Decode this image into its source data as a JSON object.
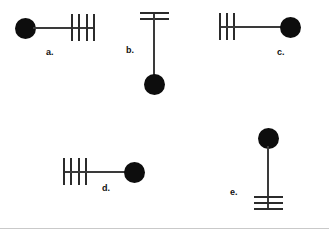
{
  "sheet": {
    "background_color": "#ffffff",
    "rule_color": "#c9c9c9",
    "width": 329,
    "height": 237
  },
  "style": {
    "dot_color": "#0d0d0d",
    "stem_color": "#3a3a3a",
    "tick_color": "#2b2b2b",
    "label_color": "#111111"
  },
  "figures": [
    {
      "id": "a",
      "label": "a.",
      "orientation": "horizontal",
      "dot_side": "left",
      "tick_side": "right",
      "tick_count": 4,
      "ticks": [
        "tick-1",
        "tick-2",
        "tick-3",
        "tick-4"
      ]
    },
    {
      "id": "b",
      "label": "b.",
      "orientation": "vertical",
      "dot_side": "bottom",
      "tick_side": "top",
      "tick_count": 2,
      "ticks": [
        "tick-1",
        "tick-2"
      ]
    },
    {
      "id": "c",
      "label": "c.",
      "orientation": "horizontal",
      "dot_side": "right",
      "tick_side": "left",
      "tick_count": 3,
      "ticks": [
        "tick-1",
        "tick-2",
        "tick-3"
      ]
    },
    {
      "id": "d",
      "label": "d.",
      "orientation": "horizontal",
      "dot_side": "right",
      "tick_side": "left",
      "tick_count": 4,
      "ticks": [
        "tick-1",
        "tick-2",
        "tick-3",
        "tick-4"
      ]
    },
    {
      "id": "e",
      "label": "e.",
      "orientation": "vertical",
      "dot_side": "top",
      "tick_side": "bottom",
      "tick_count": 3,
      "ticks": [
        "tick-1",
        "tick-2",
        "tick-3"
      ]
    }
  ]
}
